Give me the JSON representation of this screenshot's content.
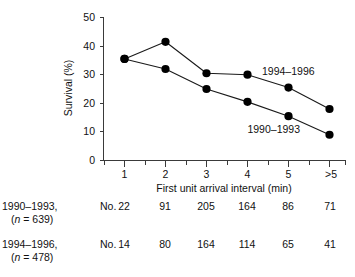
{
  "chart_data": {
    "type": "line",
    "title": "",
    "xlabel": "First unit arrival interval (min)",
    "ylabel": "Survival (%)",
    "categories": [
      "1",
      "2",
      "3",
      "4",
      "5",
      ">5"
    ],
    "x_tick_labels": [
      "1",
      "2",
      "3",
      "4",
      "5",
      ">5"
    ],
    "y_tick_labels": [
      "0",
      "10",
      "20",
      "30",
      "40",
      "50"
    ],
    "y_ticks": [
      0,
      10,
      20,
      30,
      40,
      50
    ],
    "ylim": [
      0,
      50
    ],
    "grid": false,
    "legend_position": "inline-annotation",
    "marker": "filled-circle",
    "series": [
      {
        "name": "1994–1996",
        "label": "1994–1996",
        "values": [
          35.5,
          41.5,
          30.5,
          30.0,
          25.5,
          18.0
        ]
      },
      {
        "name": "1990–1993",
        "label": "1990–1993",
        "values": [
          35.5,
          32.0,
          25.0,
          20.5,
          15.5,
          9.0
        ]
      }
    ]
  },
  "counts_table": {
    "rows": [
      {
        "period": "1990–1993,",
        "n_prefix": "(",
        "n_italic": "n",
        "n_suffix": " = 639)",
        "n_text": "(n = 639)",
        "unit": "No.",
        "values": [
          "22",
          "91",
          "205",
          "164",
          "86",
          "71"
        ]
      },
      {
        "period": "1994–1996,",
        "n_prefix": "(",
        "n_italic": "n",
        "n_suffix": " = 478)",
        "n_text": "(n = 478)",
        "unit": "No.",
        "values": [
          "14",
          "80",
          "164",
          "114",
          "65",
          "41"
        ]
      }
    ]
  },
  "colors": {
    "marker": "#000000",
    "line": "#1a1a1a",
    "axis": "#3a3a3a",
    "text": "#111111",
    "background": "#ffffff"
  }
}
